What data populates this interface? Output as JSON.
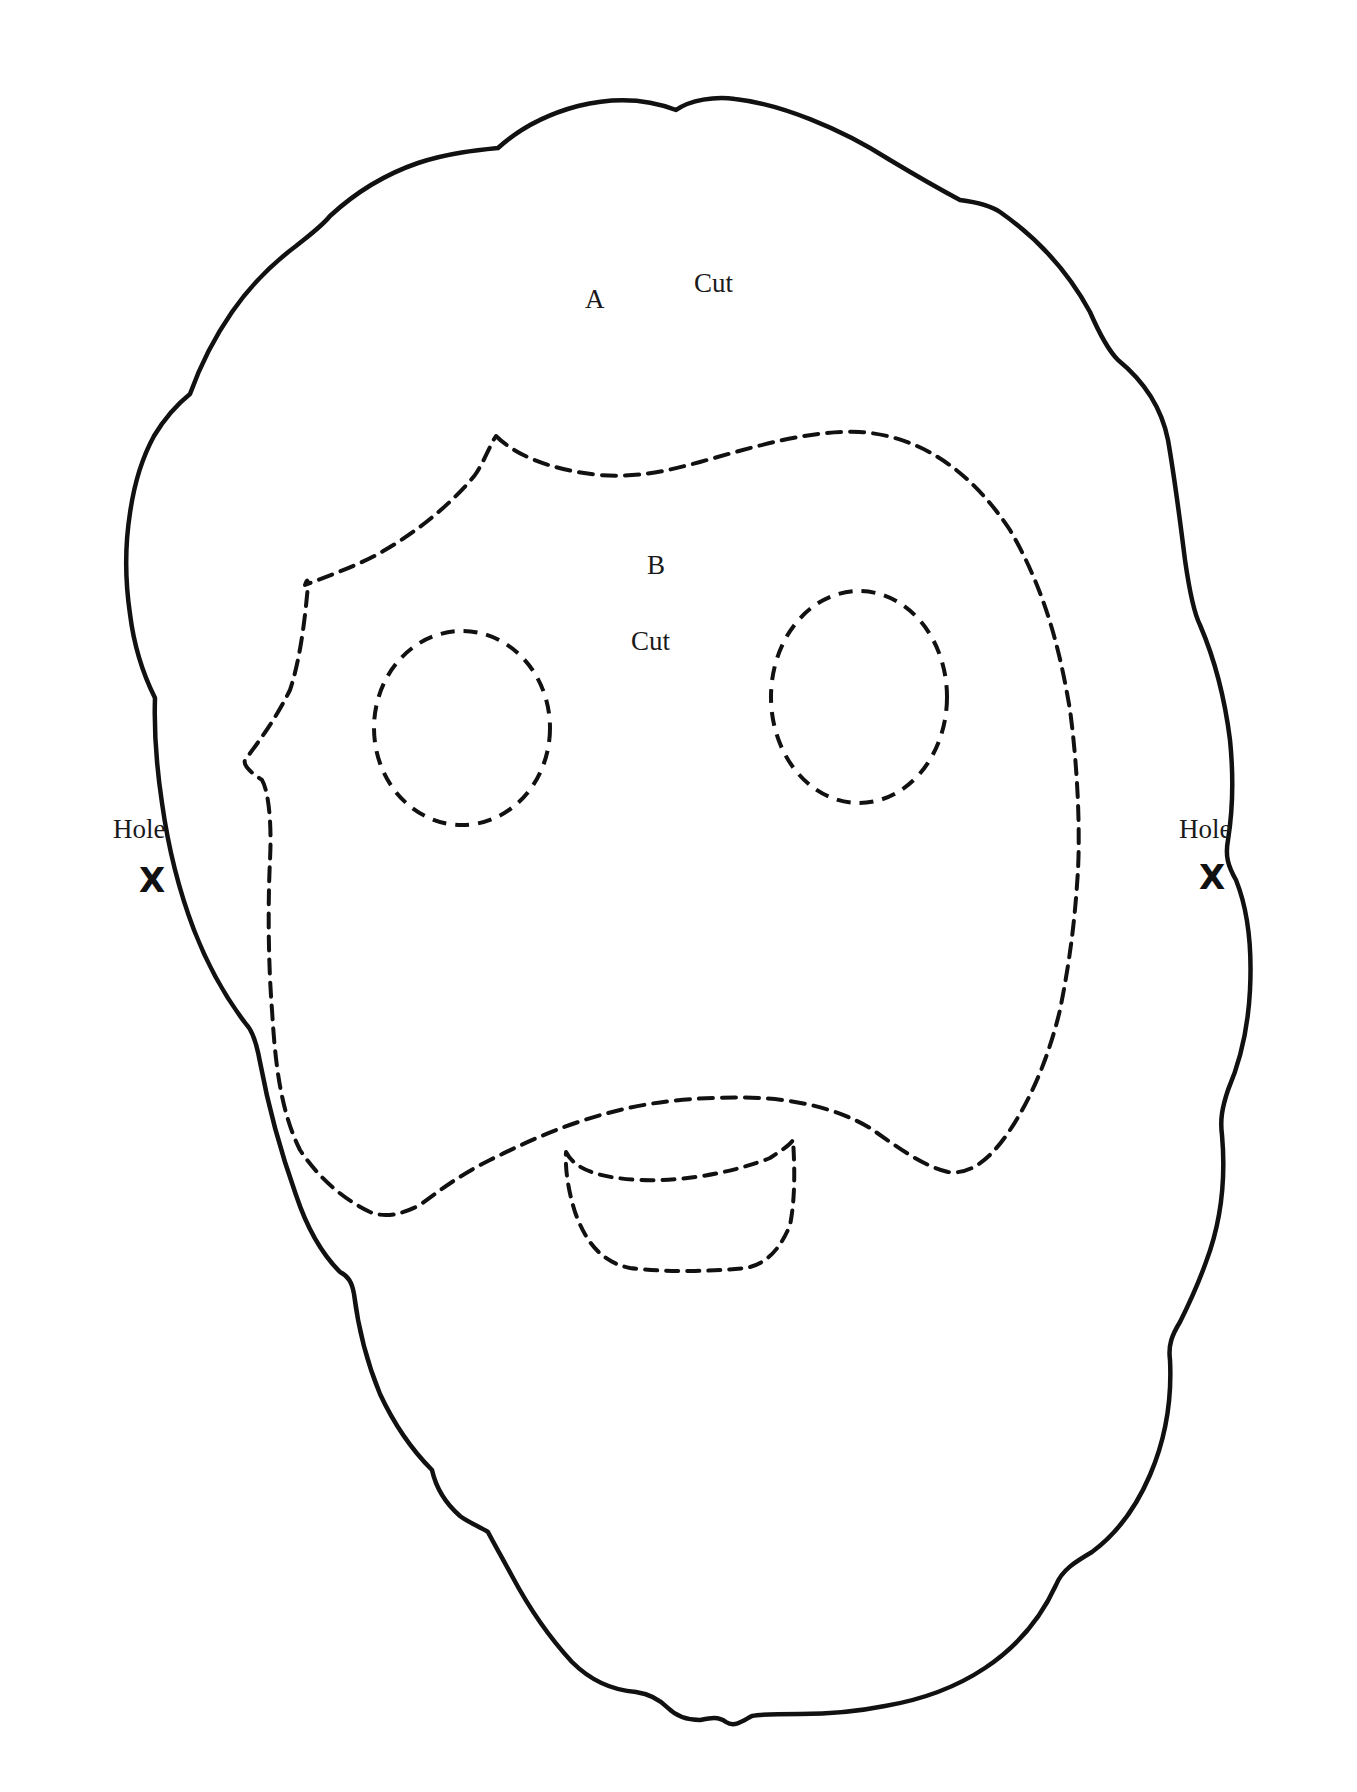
{
  "template": {
    "title": "Face mask cut-out template",
    "colors": {
      "line": "#111111",
      "text": "#1a1a1a",
      "background": "#ffffff"
    }
  },
  "labels": {
    "outer_letter": "A",
    "outer_instruction": "Cut",
    "inner_letter": "B",
    "inner_instruction": "Cut",
    "left_hole": "Hole",
    "right_hole": "Hole",
    "left_hole_mark": "X",
    "right_hole_mark": "X"
  },
  "shapes": {
    "outer_outline": "solid",
    "face_cutout": "dashed",
    "left_eye": "dashed",
    "right_eye": "dashed",
    "mouth": "dashed"
  }
}
